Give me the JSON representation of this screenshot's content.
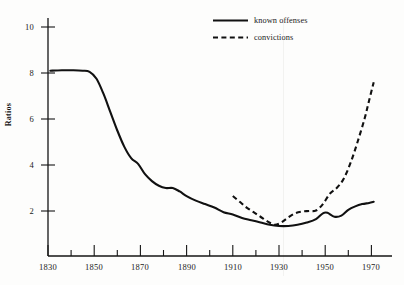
{
  "chart_data": {
    "type": "line",
    "title": "",
    "subtitle": "",
    "xlabel": "",
    "ylabel": "Ratios",
    "xlim": [
      1830,
      1975
    ],
    "ylim": [
      0,
      10.6
    ],
    "grid": false,
    "legend_position": "top-right",
    "x_ticks_major": [
      1830,
      1850,
      1870,
      1890,
      1910,
      1930,
      1950,
      1970
    ],
    "x_ticks_minor": [
      1840,
      1860,
      1880,
      1900,
      1920,
      1940,
      1960
    ],
    "y_ticks_major": [
      2,
      4,
      6,
      8,
      10
    ],
    "series": [
      {
        "name": "known offenses",
        "style": "solid",
        "color": "#111111",
        "points": [
          [
            1831,
            8.1
          ],
          [
            1836,
            8.12
          ],
          [
            1841,
            8.12
          ],
          [
            1845,
            8.1
          ],
          [
            1848,
            8.05
          ],
          [
            1851,
            7.75
          ],
          [
            1854,
            7.1
          ],
          [
            1857,
            6.3
          ],
          [
            1860,
            5.5
          ],
          [
            1863,
            4.8
          ],
          [
            1866,
            4.3
          ],
          [
            1869,
            4.05
          ],
          [
            1872,
            3.6
          ],
          [
            1875,
            3.3
          ],
          [
            1878,
            3.1
          ],
          [
            1881,
            3.0
          ],
          [
            1884,
            3.0
          ],
          [
            1887,
            2.85
          ],
          [
            1890,
            2.65
          ],
          [
            1894,
            2.45
          ],
          [
            1898,
            2.3
          ],
          [
            1902,
            2.15
          ],
          [
            1906,
            1.95
          ],
          [
            1910,
            1.85
          ],
          [
            1914,
            1.7
          ],
          [
            1918,
            1.6
          ],
          [
            1922,
            1.5
          ],
          [
            1926,
            1.4
          ],
          [
            1930,
            1.35
          ],
          [
            1934,
            1.35
          ],
          [
            1938,
            1.4
          ],
          [
            1942,
            1.5
          ],
          [
            1946,
            1.65
          ],
          [
            1949,
            1.9
          ],
          [
            1951,
            1.92
          ],
          [
            1954,
            1.75
          ],
          [
            1957,
            1.8
          ],
          [
            1960,
            2.05
          ],
          [
            1963,
            2.2
          ],
          [
            1966,
            2.3
          ],
          [
            1969,
            2.35
          ],
          [
            1971,
            2.4
          ]
        ]
      },
      {
        "name": "convictions",
        "style": "dashed",
        "color": "#111111",
        "points": [
          [
            1910,
            2.65
          ],
          [
            1913,
            2.4
          ],
          [
            1916,
            2.15
          ],
          [
            1919,
            1.95
          ],
          [
            1922,
            1.75
          ],
          [
            1925,
            1.55
          ],
          [
            1928,
            1.4
          ],
          [
            1931,
            1.5
          ],
          [
            1934,
            1.72
          ],
          [
            1937,
            1.9
          ],
          [
            1940,
            1.98
          ],
          [
            1943,
            2.0
          ],
          [
            1946,
            2.02
          ],
          [
            1949,
            2.3
          ],
          [
            1952,
            2.75
          ],
          [
            1955,
            3.0
          ],
          [
            1958,
            3.4
          ],
          [
            1961,
            4.1
          ],
          [
            1964,
            5.0
          ],
          [
            1967,
            6.0
          ],
          [
            1969,
            6.8
          ],
          [
            1971,
            7.6
          ]
        ]
      }
    ]
  },
  "axes": {
    "y_tick_labels": [
      "10",
      "8",
      "6",
      "4",
      "2"
    ],
    "x_tick_labels": [
      "1830",
      "1850",
      "1870",
      "1890",
      "1910",
      "1930",
      "1950",
      "1970"
    ],
    "y_axis_title": "Ratios"
  },
  "legend": {
    "entries": [
      {
        "label": "known offenses",
        "style": "solid"
      },
      {
        "label": "convictions",
        "style": "dashed"
      }
    ]
  }
}
